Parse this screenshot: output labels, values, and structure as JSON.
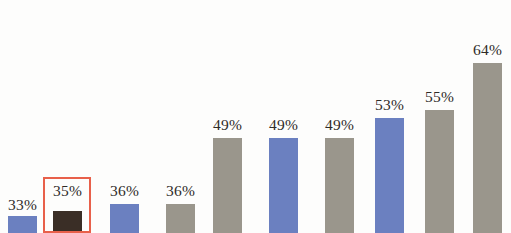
{
  "chart_data": {
    "type": "bar",
    "title": "",
    "subtitle": "",
    "xlabel": "",
    "ylabel": "",
    "categories": [
      "1",
      "2",
      "3",
      "4",
      "5",
      "6",
      "7",
      "8",
      "9",
      "10"
    ],
    "values": [
      33,
      35,
      36,
      36,
      49,
      49,
      49,
      53,
      55,
      64
    ],
    "data_labels": [
      "33%",
      "35%",
      "36%",
      "36%",
      "49%",
      "49%",
      "49%",
      "53%",
      "55%",
      "64%"
    ],
    "ylim": [
      0,
      70
    ],
    "grid": false,
    "legend": "none",
    "bar_colors": [
      "#6b80c0",
      "#3a2e26",
      "#6b80c0",
      "#9a968c",
      "#9a968c",
      "#6b80c0",
      "#9a968c",
      "#6b80c0",
      "#9a968c",
      "#9a968c"
    ],
    "annotations": [
      {
        "type": "highlight-rectangle",
        "target_index": 1,
        "target_label": "35%",
        "color": "#e8604a"
      }
    ],
    "note": "Bars are cropped at the bottom edge of the image frame; baseline is below the visible area."
  },
  "series": [
    {
      "name": "series-1",
      "bars": [
        {
          "label": "33%",
          "value": 33,
          "color": "#6b80c0",
          "x": 8,
          "width": 29,
          "top": 216,
          "label_top": 196,
          "highlighted": false
        },
        {
          "label": "35%",
          "value": 35,
          "color": "#3a2e26",
          "x": 53,
          "width": 29,
          "top": 211,
          "label_top": 182,
          "highlighted": true
        },
        {
          "label": "36%",
          "value": 36,
          "color": "#6b80c0",
          "x": 110,
          "width": 29,
          "top": 204,
          "label_top": 182,
          "highlighted": false
        },
        {
          "label": "36%",
          "value": 36,
          "color": "#9a968c",
          "x": 166,
          "width": 29,
          "top": 204,
          "label_top": 182,
          "highlighted": false
        },
        {
          "label": "49%",
          "value": 49,
          "color": "#9a968c",
          "x": 213,
          "width": 29,
          "top": 138,
          "label_top": 116,
          "highlighted": false
        },
        {
          "label": "49%",
          "value": 49,
          "color": "#6b80c0",
          "x": 269,
          "width": 29,
          "top": 138,
          "label_top": 116,
          "highlighted": false
        },
        {
          "label": "49%",
          "value": 49,
          "color": "#9a968c",
          "x": 325,
          "width": 29,
          "top": 138,
          "label_top": 116,
          "highlighted": false
        },
        {
          "label": "53%",
          "value": 53,
          "color": "#6b80c0",
          "x": 375,
          "width": 29,
          "top": 118,
          "label_top": 96,
          "highlighted": false
        },
        {
          "label": "55%",
          "value": 55,
          "color": "#9a968c",
          "x": 425,
          "width": 29,
          "top": 110,
          "label_top": 88,
          "highlighted": false
        },
        {
          "label": "64%",
          "value": 64,
          "color": "#9a968c",
          "x": 473,
          "width": 29,
          "top": 63,
          "label_top": 41,
          "highlighted": false
        }
      ]
    }
  ],
  "highlight": {
    "name": "highlight-rectangle",
    "color": "#e8604a",
    "border_width": 2,
    "x": 43,
    "y": 177,
    "width": 48,
    "height": 56
  }
}
